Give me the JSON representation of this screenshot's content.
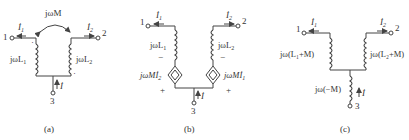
{
  "figure": {
    "panels": [
      {
        "id": "a",
        "caption": "(a)",
        "port1": "1",
        "port2": "2",
        "port3": "3",
        "current1": "İ",
        "current1_sub": "1",
        "current2": "İ",
        "current2_sub": "2",
        "current3": "İ",
        "mutual": "jωM",
        "inductor1": "jωL",
        "inductor1_sub": "1",
        "inductor2": "jωL",
        "inductor2_sub": "2",
        "dot1": "·",
        "dot2": "·"
      },
      {
        "id": "b",
        "caption": "(b)",
        "port1": "1",
        "port2": "2",
        "port3": "3",
        "current1": "İ",
        "current1_sub": "1",
        "current2": "İ",
        "current2_sub": "2",
        "current3": "İ",
        "inductor1": "jωL",
        "inductor1_sub": "1",
        "inductor2": "jωL",
        "inductor2_sub": "2",
        "source1": "jωMİ",
        "source1_sub": "2",
        "source2": "jωMİ",
        "source2_sub": "1",
        "minus": "−",
        "plus": "+"
      },
      {
        "id": "c",
        "caption": "(c)",
        "port1": "1",
        "port2": "2",
        "port3": "3",
        "current1": "İ",
        "current1_sub": "1",
        "current2": "İ",
        "current2_sub": "2",
        "current3": "İ",
        "inductor1": "jω(L₁+M)",
        "inductor2": "jω(L₂+M)",
        "inductor3": "jω(−M)"
      }
    ]
  }
}
